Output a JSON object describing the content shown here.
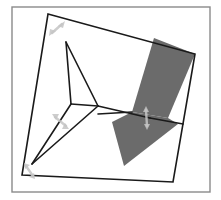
{
  "diagram": {
    "type": "geometric-figure",
    "colors": {
      "background": "#ffffff",
      "frame": "#8a8a8a",
      "edge": "#1a1a1a",
      "shade": "#6b6b6b",
      "arrow": "#c4c4c4"
    },
    "shapes": {
      "quadrilateral_vertices": [
        "top-left",
        "top-right",
        "bottom-right",
        "bottom-left"
      ],
      "internal_nodes": [
        "node-a",
        "node-b"
      ],
      "shaded_regions": 2,
      "double_arrows": 4
    }
  }
}
